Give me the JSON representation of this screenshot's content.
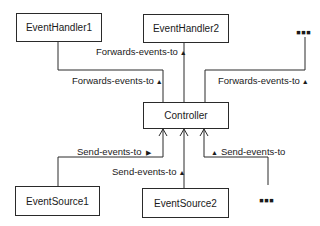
{
  "diagram": {
    "nodes": {
      "handler1": "EventHandler1",
      "handler2": "EventHandler2",
      "handler_more": "▪▪▪",
      "controller": "Controller",
      "source1": "EventSource1",
      "source2": "EventSource2",
      "source_more": "▪▪▪"
    },
    "edges": {
      "h1_label": "Forwards-events-to",
      "h2_label": "Forwards-events-to",
      "hmore_label": "Forwards-events-to",
      "s1_label": "Send-events-to",
      "s2_label": "Send-events-to",
      "smore_label": "Send-events-to"
    },
    "direction_glyphs": {
      "up": "▲",
      "right": "▶"
    }
  }
}
